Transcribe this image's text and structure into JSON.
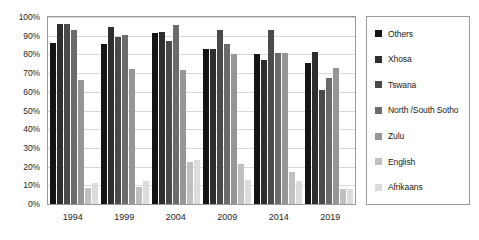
{
  "chart_data": {
    "type": "bar",
    "title": "",
    "subtitle": "",
    "xlabel": "",
    "ylabel": "",
    "ylim": [
      0,
      100
    ],
    "ytick_labels": [
      "100%",
      "90%",
      "80%",
      "70%",
      "60%",
      "50%",
      "40%",
      "30%",
      "20%",
      "10%",
      "0%"
    ],
    "ytick_values": [
      100,
      90,
      80,
      70,
      60,
      50,
      40,
      30,
      20,
      10,
      0
    ],
    "grid": true,
    "legend_position": "right",
    "categories": [
      "1994",
      "1999",
      "2004",
      "2009",
      "2014",
      "2019"
    ],
    "series": [
      {
        "name": "Others",
        "color": "#141414",
        "values": [
          86.0,
          85.5,
          91.5,
          83.0,
          80.0,
          75.5
        ]
      },
      {
        "name": "Xhosa",
        "color": "#2e2e2e",
        "values": [
          96.5,
          94.5,
          91.8,
          83.0,
          77.0,
          81.5
        ]
      },
      {
        "name": "Tswana",
        "color": "#4a4a4a",
        "values": [
          96.5,
          89.5,
          87.0,
          93.0,
          93.0,
          61.0
        ]
      },
      {
        "name": "North /South Sotho",
        "color": "#6b6b6b",
        "values": [
          93.0,
          90.5,
          95.5,
          85.5,
          81.0,
          67.5
        ]
      },
      {
        "name": "Zulu",
        "color": "#969696",
        "values": [
          66.5,
          72.0,
          71.5,
          80.0,
          80.5,
          73.0
        ]
      },
      {
        "name": "English",
        "color": "#c0c0c0",
        "values": [
          8.5,
          9.0,
          22.5,
          21.5,
          17.0,
          8.0
        ]
      },
      {
        "name": "Afrikaans",
        "color": "#dcdcdc",
        "values": [
          11.0,
          12.5,
          23.5,
          13.0,
          12.5,
          8.0
        ]
      }
    ]
  },
  "style": {
    "plot_border_color": "#9a9a9a",
    "gridline_color": "#d9d9d9",
    "background": "#ffffff",
    "text_color": "#262626"
  }
}
